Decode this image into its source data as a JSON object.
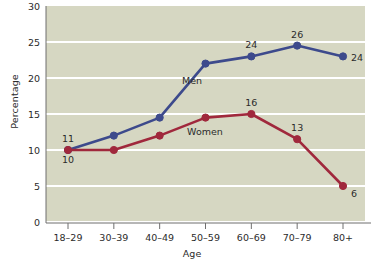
{
  "chart_data": {
    "type": "line",
    "title": "",
    "xlabel": "Age",
    "ylabel": "Percentage",
    "categories": [
      "18–29",
      "30–39",
      "40–49",
      "50–59",
      "60–69",
      "70–79",
      "80+"
    ],
    "ylim": [
      0,
      30
    ],
    "yticks": [
      0,
      5,
      10,
      15,
      20,
      25,
      30
    ],
    "ytick_labels": [
      "0",
      "5",
      "10",
      "15",
      "20",
      "25",
      "30"
    ],
    "grid": true,
    "legend_position": "inline-annotation",
    "series": [
      {
        "name": "Men",
        "color": "#3d4a8c",
        "values": [
          10,
          12,
          14.5,
          22,
          23,
          24.5,
          23
        ],
        "point_labels": [
          "10",
          "",
          "",
          "",
          "24",
          "26",
          "24"
        ],
        "label_positions": [
          "below",
          "",
          "",
          "",
          "above",
          "above",
          "right"
        ]
      },
      {
        "name": "Women",
        "color": "#a0283c",
        "values": [
          10,
          10,
          12,
          14.5,
          15,
          11.5,
          5
        ],
        "point_labels": [
          "11",
          "",
          "",
          "",
          "16",
          "13",
          "6"
        ],
        "label_positions": [
          "above",
          "",
          "",
          "",
          "above",
          "above",
          "right-below"
        ]
      }
    ],
    "annotations": [
      {
        "text": "Men",
        "series": "Men",
        "x_px": 192,
        "y_px": 84
      },
      {
        "text": "Women",
        "series": "Women",
        "x_px": 205,
        "y_px": 135
      }
    ],
    "colors": {
      "plot_background": "#d6d7c2",
      "gridline": "#ffffff",
      "axis": "#6f6f6f",
      "text": "#2b2b2b",
      "men": "#3d4a8c",
      "women": "#a0283c",
      "page_background": "#ffffff"
    }
  }
}
